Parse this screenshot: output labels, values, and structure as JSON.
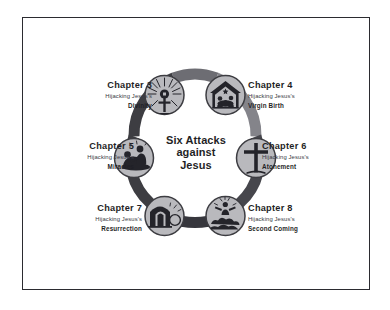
{
  "center": {
    "title_line1": "Six Attacks",
    "title_line2": "against",
    "title_line3": "Jesus"
  },
  "colors": {
    "ring_dark": "#3d3d42",
    "ring_mid": "#6d6d73",
    "ring_light": "#8a8a90",
    "node_fill": "#b9b9bd",
    "node_stroke": "#3d3d42",
    "text": "#1f1f26",
    "frame": "#2b2b30",
    "background": "#ffffff"
  },
  "nodes": [
    {
      "id": "chapter-3",
      "chapter": "Chapter 3",
      "subtitle": "Hijacking Jesus's",
      "topic": "Divinity",
      "icon": "radiant-cross-icon",
      "side": "left",
      "angle_deg": -60
    },
    {
      "id": "chapter-4",
      "chapter": "Chapter 4",
      "subtitle": "Hijacking Jesus's",
      "topic": "Virgin Birth",
      "icon": "nativity-manger-icon",
      "side": "right",
      "angle_deg": -120
    },
    {
      "id": "chapter-5",
      "chapter": "Chapter 5",
      "subtitle": "Hijacking Jesus's",
      "topic": "Miracles",
      "icon": "healing-hands-icon",
      "side": "left",
      "angle_deg": 180
    },
    {
      "id": "chapter-6",
      "chapter": "Chapter 6",
      "subtitle": "Hijacking Jesus's",
      "topic": "Atonement",
      "icon": "cross-icon",
      "side": "right",
      "angle_deg": 0
    },
    {
      "id": "chapter-7",
      "chapter": "Chapter 7",
      "subtitle": "Hijacking Jesus's",
      "topic": "Resurrection",
      "icon": "empty-tomb-icon",
      "side": "left",
      "angle_deg": 120
    },
    {
      "id": "chapter-8",
      "chapter": "Chapter 8",
      "subtitle": "Hijacking Jesus's",
      "topic": "Second Coming",
      "icon": "clouds-descent-icon",
      "side": "right",
      "angle_deg": 60
    }
  ]
}
